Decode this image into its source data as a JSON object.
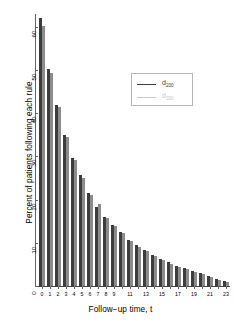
{
  "chart_data": {
    "type": "bar",
    "title": "",
    "subtitle": "",
    "xlabel": "Follow−up time, t",
    "ylabel": "Percent of patients following each rule",
    "categories": [
      0,
      1,
      2,
      3,
      4,
      5,
      6,
      7,
      8,
      9,
      10,
      11,
      12,
      13,
      14,
      15,
      16,
      17,
      18,
      19,
      20,
      21,
      22,
      23
    ],
    "x_tick_labels": [
      "0",
      "1",
      "2",
      "3",
      "4",
      "5",
      "6",
      "7",
      "8",
      "9",
      "",
      "11",
      "",
      "13",
      "",
      "15",
      "",
      "17",
      "",
      "19",
      "",
      "21",
      "",
      "23"
    ],
    "ylim": [
      0,
      63
    ],
    "xlim": [
      -0.5,
      23.5
    ],
    "y_ticks": [
      0,
      10,
      20,
      30,
      40,
      50,
      60
    ],
    "y_tick_labels": [
      "0",
      "10",
      "20",
      "30",
      "40",
      "50",
      "60"
    ],
    "grid": false,
    "legend_position": "upper-right",
    "bar_group_style": "dodged-pairs",
    "series": [
      {
        "name": "d_200",
        "label": "d",
        "sub": "200",
        "color": "#3c3c3c",
        "values": [
          62.0,
          50.2,
          42.0,
          35.0,
          29.6,
          25.6,
          21.6,
          18.2,
          16.1,
          14.2,
          12.5,
          10.7,
          9.4,
          8.3,
          7.2,
          6.3,
          5.5,
          4.6,
          4.1,
          3.4,
          2.9,
          2.3,
          1.7,
          1.1
        ]
      },
      {
        "name": "d_350",
        "label": "d",
        "sub": "350",
        "color": "#8c8c8c",
        "values": [
          60.2,
          49.3,
          41.4,
          34.6,
          29.2,
          25.0,
          21.1,
          19.1,
          15.7,
          13.9,
          12.2,
          10.4,
          9.1,
          8.0,
          7.0,
          6.1,
          5.2,
          4.4,
          3.9,
          3.2,
          2.7,
          2.1,
          1.5,
          1.0
        ]
      }
    ]
  },
  "axes": {
    "y_title": "Percent of patients following each rule",
    "x_title": "Follow−up time, t"
  },
  "legend": {
    "entries": [
      {
        "label": "d",
        "sub": "200",
        "color": "#3c3c3c"
      },
      {
        "label": "d",
        "sub": "350",
        "color": "#c9c9c9"
      }
    ]
  },
  "colors": {
    "series_1": "#3c3c3c",
    "series_2": "#8c8c8c",
    "axis": "#666666",
    "text": "#000000",
    "background": "#ffffff",
    "legend_border": "#b5b5b5"
  }
}
